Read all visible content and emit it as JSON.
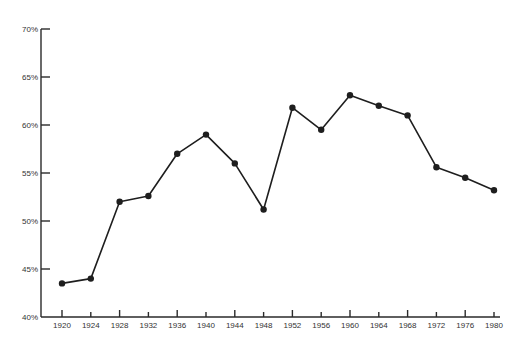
{
  "chart_data": {
    "type": "line",
    "title": "",
    "xlabel": "",
    "ylabel": "",
    "ylim": [
      40,
      70
    ],
    "y_ticks": [
      "40%",
      "45%",
      "50%",
      "55%",
      "60%",
      "65%",
      "70%"
    ],
    "y_tick_values": [
      40,
      45,
      50,
      55,
      60,
      65,
      70
    ],
    "categories": [
      "1920",
      "1924",
      "1928",
      "1932",
      "1936",
      "1940",
      "1944",
      "1948",
      "1952",
      "1956",
      "1960",
      "1964",
      "1968",
      "1972",
      "1976",
      "1980"
    ],
    "series": [
      {
        "name": "",
        "values": [
          43.5,
          44.0,
          52.0,
          52.6,
          57.0,
          59.0,
          56.0,
          51.2,
          61.8,
          59.5,
          63.1,
          62.0,
          61.0,
          55.6,
          54.5,
          53.2
        ]
      }
    ],
    "grid": false,
    "legend": "none",
    "markers": "filled-circle",
    "colors": {
      "line": "#1e1e1e",
      "axis": "#2a2a2a",
      "text": "#333333"
    }
  }
}
